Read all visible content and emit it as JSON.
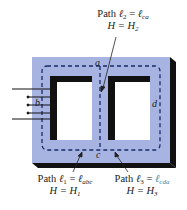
{
  "diagram": {
    "colors": {
      "core_face": "#a7b4e2",
      "core_edge": "#111111",
      "window": "#ffffff",
      "dashed_path": "#1a2a6a"
    },
    "points": {
      "a": "a",
      "b": "b",
      "c": "c",
      "d": "d"
    },
    "labels": {
      "path2": {
        "prefix": "Path ",
        "l": "ℓ",
        "sub": "2",
        "eq": " = ",
        "rhs": "ℓ",
        "rhs_sub": "ca",
        "h_line": "H = H",
        "h_sub": "2"
      },
      "path1": {
        "prefix": "Path ",
        "l": "ℓ",
        "sub": "1",
        "eq": " = ",
        "rhs": "ℓ",
        "rhs_sub": "abc",
        "h_line": "H = H",
        "h_sub": "1"
      },
      "path3": {
        "prefix": "Path ",
        "l": "ℓ",
        "sub": "3",
        "eq": " = ",
        "rhs": "ℓ",
        "rhs_sub": "cda",
        "h_line": "H = H",
        "h_sub": "3"
      }
    }
  }
}
